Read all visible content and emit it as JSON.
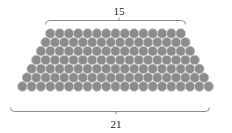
{
  "figure": {
    "name": "trapezoidal-circle-packing-diagram",
    "background_color": "#ffffff",
    "circle": {
      "fill_color": "#8c8c8c",
      "stroke_color": "#c9c9c9",
      "radius": 4.85,
      "stroke_width": 0.9
    },
    "bracket": {
      "color": "#6e6e6e",
      "stroke_width": 0.8
    },
    "top_label": "15",
    "bottom_label": "21",
    "rows": [
      {
        "count": 15,
        "label": "top-row"
      },
      {
        "count": 16,
        "label": "row-2"
      },
      {
        "count": 17,
        "label": "row-3"
      },
      {
        "count": 18,
        "label": "row-4"
      },
      {
        "count": 19,
        "label": "row-5"
      },
      {
        "count": 20,
        "label": "row-6"
      },
      {
        "count": 21,
        "label": "bottom-row"
      }
    ]
  },
  "chart_data": {
    "type": "bar",
    "title": "",
    "xlabel": "",
    "ylabel": "",
    "categories": [
      "row 1",
      "row 2",
      "row 3",
      "row 4",
      "row 5",
      "row 6",
      "row 7"
    ],
    "values": [
      15,
      16,
      17,
      18,
      19,
      20,
      21
    ],
    "annotations": [
      "15",
      "21"
    ],
    "total": 126
  }
}
